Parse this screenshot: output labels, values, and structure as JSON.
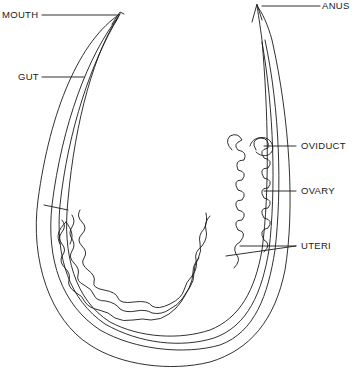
{
  "diagram": {
    "labels": {
      "mouth": "MOUTH",
      "gut": "GUT",
      "anus": "ANUS",
      "oviduct": "OVIDUCT",
      "ovary": "OVARY",
      "uteri": "UTERI"
    },
    "colors": {
      "line": "#1a1a1a",
      "background": "#ffffff"
    }
  }
}
